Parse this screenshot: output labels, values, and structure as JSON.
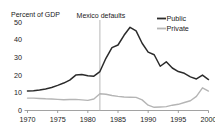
{
  "chart_data": {
    "type": "line",
    "title": "",
    "ylabel": "Percent of GDP",
    "xlabel": "",
    "xlim": [
      1970,
      2000
    ],
    "ylim": [
      0,
      50
    ],
    "grid": false,
    "legend_position": "top-right",
    "yticks": [
      "0",
      "10",
      "20",
      "30",
      "40",
      "50"
    ],
    "ytick_values": [
      0,
      10,
      20,
      30,
      40,
      50
    ],
    "xticks": [
      "1970",
      "1975",
      "1980",
      "1985",
      "1990",
      "1995",
      "2000"
    ],
    "xtick_values": [
      1970,
      1975,
      1980,
      1985,
      1990,
      1995,
      2000
    ],
    "x": [
      1970,
      1971,
      1972,
      1973,
      1974,
      1975,
      1976,
      1977,
      1978,
      1979,
      1980,
      1981,
      1982,
      1983,
      1984,
      1985,
      1986,
      1987,
      1988,
      1989,
      1990,
      1991,
      1992,
      1993,
      1994,
      1995,
      1996,
      1997,
      1998,
      1999,
      2000
    ],
    "series": [
      {
        "name": "Public",
        "color": "#2b2b2b",
        "values": [
          11.0,
          11.2,
          11.6,
          12.2,
          13.0,
          14.2,
          15.5,
          17.2,
          20.0,
          20.3,
          19.6,
          19.4,
          22.0,
          29.5,
          35.5,
          37.0,
          42.5,
          47.0,
          45.0,
          38.0,
          33.0,
          31.5,
          25.0,
          27.5,
          24.0,
          22.0,
          21.0,
          19.0,
          17.8,
          20.0,
          17.5
        ]
      },
      {
        "name": "Private",
        "color": "#b5b5b5",
        "values": [
          7.0,
          7.0,
          6.8,
          6.6,
          6.5,
          6.3,
          6.1,
          6.2,
          6.3,
          6.0,
          5.7,
          6.5,
          9.5,
          9.2,
          8.5,
          8.0,
          7.6,
          7.5,
          7.4,
          6.0,
          3.0,
          1.8,
          2.0,
          2.2,
          3.0,
          3.5,
          4.5,
          5.5,
          8.0,
          12.8,
          11.0
        ]
      }
    ],
    "annotations": [
      {
        "label": "Mexico defaults",
        "x": 1982,
        "type": "vertical-line"
      }
    ]
  },
  "legend": {
    "items": [
      {
        "label": "Public"
      },
      {
        "label": "Private"
      }
    ]
  }
}
